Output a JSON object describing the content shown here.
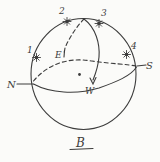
{
  "figure": {
    "type": "hand-drawn sphere diagram",
    "caption": "B",
    "compass": {
      "north": "N",
      "south": "S",
      "east": "E",
      "west": "W"
    },
    "points": [
      {
        "label": "1"
      },
      {
        "label": "2"
      },
      {
        "label": "3"
      },
      {
        "label": "4"
      }
    ],
    "colors": {
      "ink": "#3c3c3c",
      "paper": "#fbfbf9"
    }
  }
}
